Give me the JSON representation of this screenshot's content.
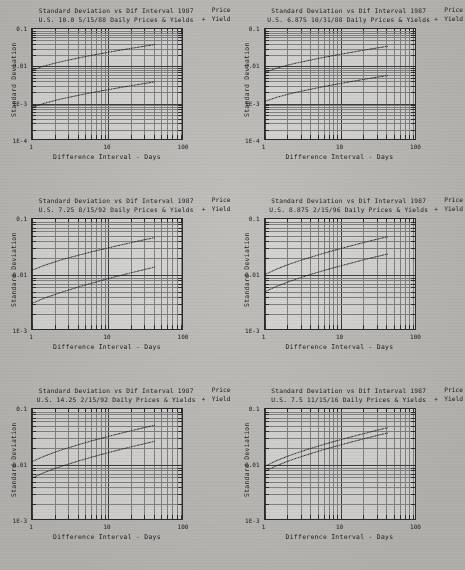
{
  "page": {
    "background_color": "#b9b8b4",
    "ink_color": "#1a1a1a",
    "layout": "2 columns x 3 rows of log-log scatter plots"
  },
  "common": {
    "title_line1": "Standard Deviation vs Dif Interval 1987",
    "xlabel": "Difference Interval - Days",
    "ylabel": "Standard Deviation",
    "xticks": [
      "1",
      "10",
      "100"
    ],
    "legend": {
      "price_label": "Price",
      "yield_label": "Yield",
      "marker": "+"
    }
  },
  "chart_data": [
    {
      "id": "panel-1",
      "type": "scatter",
      "title": "Standard Deviation vs Dif Interval 1987",
      "subtitle": "U.S. 10.0 5/15/88 Daily Prices & Yields",
      "xlabel": "Difference Interval - Days",
      "ylabel": "Standard Deviation",
      "xscale": "log",
      "yscale": "log",
      "xlim": [
        1,
        100
      ],
      "ylim": [
        0.0001,
        0.1
      ],
      "xticklabels": [
        "1",
        "10",
        "100"
      ],
      "yticklabels": [
        "0.1",
        "0.01",
        "1E-3",
        "1E-4"
      ],
      "grid": true,
      "legend_position": "top-right",
      "series": [
        {
          "name": "Price",
          "x": [
            1,
            1.4,
            2,
            2.6,
            3,
            4,
            5,
            6,
            7,
            8,
            9,
            10,
            12,
            14,
            16,
            18,
            20,
            24,
            28,
            32,
            36,
            40
          ],
          "y": [
            0.0082,
            0.0104,
            0.0126,
            0.0143,
            0.0152,
            0.0172,
            0.0189,
            0.0203,
            0.0215,
            0.0226,
            0.0236,
            0.0245,
            0.0262,
            0.0277,
            0.029,
            0.0302,
            0.0313,
            0.0333,
            0.035,
            0.0365,
            0.0379,
            0.0392
          ]
        },
        {
          "name": "Yield",
          "x": [
            1,
            1.4,
            2,
            2.6,
            3,
            4,
            5,
            6,
            7,
            8,
            9,
            10,
            12,
            14,
            16,
            18,
            20,
            24,
            28,
            32,
            36,
            40
          ],
          "y": [
            0.00082,
            0.00104,
            0.00126,
            0.00143,
            0.00152,
            0.00172,
            0.00189,
            0.00203,
            0.00215,
            0.00226,
            0.00236,
            0.00245,
            0.00262,
            0.00277,
            0.0029,
            0.00302,
            0.00313,
            0.00333,
            0.0035,
            0.00365,
            0.00379,
            0.00392
          ]
        }
      ]
    },
    {
      "id": "panel-2",
      "type": "scatter",
      "title": "Standard Deviation vs Dif Interval 1987",
      "subtitle": "U.S. 6.875 10/31/88 Daily Prices & Yields",
      "xlabel": "Difference Interval - Days",
      "ylabel": "Standard Deviation",
      "xscale": "log",
      "yscale": "log",
      "xlim": [
        1,
        100
      ],
      "ylim": [
        0.0001,
        0.1
      ],
      "xticklabels": [
        "1",
        "10",
        "100"
      ],
      "yticklabels": [
        "0.1",
        "0.01",
        "1E-3",
        "1E-4"
      ],
      "grid": true,
      "legend_position": "top-right",
      "series": [
        {
          "name": "Price",
          "x": [
            1,
            1.4,
            2,
            2.6,
            3,
            4,
            5,
            6,
            7,
            8,
            9,
            10,
            12,
            14,
            16,
            18,
            20,
            24,
            28,
            32,
            36,
            40
          ],
          "y": [
            0.0072,
            0.0092,
            0.0112,
            0.0127,
            0.0135,
            0.0153,
            0.0168,
            0.0181,
            0.0192,
            0.0202,
            0.0211,
            0.0219,
            0.0234,
            0.0248,
            0.026,
            0.0271,
            0.0281,
            0.0299,
            0.0315,
            0.0329,
            0.0342,
            0.0354
          ]
        },
        {
          "name": "Yield",
          "x": [
            1,
            1.4,
            2,
            2.6,
            3,
            4,
            5,
            6,
            7,
            8,
            9,
            10,
            12,
            14,
            16,
            18,
            20,
            24,
            28,
            32,
            36,
            40
          ],
          "y": [
            0.0012,
            0.00152,
            0.00185,
            0.0021,
            0.00223,
            0.00252,
            0.00277,
            0.00298,
            0.00317,
            0.00333,
            0.00348,
            0.00361,
            0.00386,
            0.00409,
            0.00429,
            0.00447,
            0.00463,
            0.00493,
            0.00519,
            0.00542,
            0.00563,
            0.00583
          ]
        }
      ]
    },
    {
      "id": "panel-3",
      "type": "scatter",
      "title": "Standard Deviation vs Dif Interval 1987",
      "subtitle": "U.S. 7.25 8/15/92 Daily Prices & Yields",
      "xlabel": "Difference Interval - Days",
      "ylabel": "Standard Deviation",
      "xscale": "log",
      "yscale": "log",
      "xlim": [
        1,
        100
      ],
      "ylim": [
        0.001,
        0.1
      ],
      "xticklabels": [
        "1",
        "10",
        "100"
      ],
      "yticklabels": [
        "0.1",
        "0.01",
        "1E-3"
      ],
      "grid": true,
      "legend_position": "top-right",
      "series": [
        {
          "name": "Price",
          "x": [
            1,
            1.4,
            2,
            2.6,
            3,
            4,
            5,
            6,
            7,
            8,
            9,
            10,
            12,
            14,
            16,
            18,
            20,
            24,
            28,
            32,
            36,
            40
          ],
          "y": [
            0.0125,
            0.015,
            0.0176,
            0.0196,
            0.0207,
            0.0229,
            0.0248,
            0.0264,
            0.0278,
            0.029,
            0.0301,
            0.0311,
            0.033,
            0.0346,
            0.0361,
            0.0374,
            0.0386,
            0.0408,
            0.0427,
            0.0444,
            0.0459,
            0.0473
          ]
        },
        {
          "name": "Yield",
          "x": [
            1,
            1.4,
            2,
            2.6,
            3,
            4,
            5,
            6,
            7,
            8,
            9,
            10,
            12,
            14,
            16,
            18,
            20,
            24,
            28,
            32,
            36,
            40
          ],
          "y": [
            0.0032,
            0.0039,
            0.0046,
            0.0052,
            0.0055,
            0.0062,
            0.0068,
            0.0073,
            0.0077,
            0.0081,
            0.0085,
            0.0088,
            0.0094,
            0.0099,
            0.0104,
            0.0108,
            0.0112,
            0.0119,
            0.0125,
            0.0131,
            0.0136,
            0.0141
          ]
        }
      ]
    },
    {
      "id": "panel-4",
      "type": "scatter",
      "title": "Standard Deviation vs Dif Interval 1987",
      "subtitle": "U.S. 8.875 2/15/96 Daily Prices & Yields",
      "xlabel": "Difference Interval - Days",
      "ylabel": "Standard Deviation",
      "xscale": "log",
      "yscale": "log",
      "xlim": [
        1,
        100
      ],
      "ylim": [
        0.001,
        0.1
      ],
      "xticklabels": [
        "1",
        "10",
        "100"
      ],
      "yticklabels": [
        "0.1",
        "0.01",
        "1E-3"
      ],
      "grid": true,
      "legend_position": "top-right",
      "series": [
        {
          "name": "Price",
          "x": [
            1,
            1.4,
            2,
            2.6,
            3,
            4,
            5,
            6,
            7,
            8,
            9,
            10,
            12,
            14,
            16,
            18,
            20,
            24,
            28,
            32,
            36,
            40
          ],
          "y": [
            0.0105,
            0.013,
            0.0157,
            0.0177,
            0.0189,
            0.0213,
            0.0234,
            0.0252,
            0.0267,
            0.0281,
            0.0293,
            0.0305,
            0.0326,
            0.0344,
            0.0361,
            0.0376,
            0.039,
            0.0415,
            0.0437,
            0.0456,
            0.0474,
            0.049
          ]
        },
        {
          "name": "Yield",
          "x": [
            1,
            1.4,
            2,
            2.6,
            3,
            4,
            5,
            6,
            7,
            8,
            9,
            10,
            12,
            14,
            16,
            18,
            20,
            24,
            28,
            32,
            36,
            40
          ],
          "y": [
            0.0052,
            0.0064,
            0.0077,
            0.0087,
            0.0093,
            0.0105,
            0.0115,
            0.0124,
            0.0131,
            0.0138,
            0.0144,
            0.015,
            0.016,
            0.0169,
            0.0177,
            0.0185,
            0.0192,
            0.0204,
            0.0215,
            0.0224,
            0.0233,
            0.0241
          ]
        }
      ]
    },
    {
      "id": "panel-5",
      "type": "scatter",
      "title": "Standard Deviation vs Dif Interval 1987",
      "subtitle": "U.S. 14.25 2/15/92 Daily Prices & Yields",
      "xlabel": "Difference Interval - Days",
      "ylabel": "Standard Deviation",
      "xscale": "log",
      "yscale": "log",
      "xlim": [
        1,
        100
      ],
      "ylim": [
        0.001,
        0.1
      ],
      "xticklabels": [
        "1",
        "10",
        "100"
      ],
      "yticklabels": [
        "0.1",
        "0.01",
        "1E-3"
      ],
      "grid": true,
      "legend_position": "top-right",
      "series": [
        {
          "name": "Price",
          "x": [
            1,
            1.4,
            2,
            2.6,
            3,
            4,
            5,
            6,
            7,
            8,
            9,
            10,
            12,
            14,
            16,
            18,
            20,
            24,
            28,
            32,
            36,
            40
          ],
          "y": [
            0.0118,
            0.0145,
            0.0174,
            0.0196,
            0.0208,
            0.0234,
            0.0256,
            0.0275,
            0.0291,
            0.0305,
            0.0318,
            0.033,
            0.0352,
            0.0371,
            0.0388,
            0.0404,
            0.0418,
            0.0444,
            0.0466,
            0.0486,
            0.0504,
            0.0521
          ]
        },
        {
          "name": "Yield",
          "x": [
            1,
            1.4,
            2,
            2.6,
            3,
            4,
            5,
            6,
            7,
            8,
            9,
            10,
            12,
            14,
            16,
            18,
            20,
            24,
            28,
            32,
            36,
            40
          ],
          "y": [
            0.006,
            0.0074,
            0.0089,
            0.01,
            0.0106,
            0.012,
            0.0131,
            0.0141,
            0.0149,
            0.0157,
            0.0163,
            0.017,
            0.0181,
            0.0191,
            0.02,
            0.0208,
            0.0216,
            0.0229,
            0.024,
            0.0251,
            0.026,
            0.0269
          ]
        }
      ]
    },
    {
      "id": "panel-6",
      "type": "scatter",
      "title": "Standard Deviation vs Dif Interval 1987",
      "subtitle": "U.S. 7.5 11/15/16 Daily Prices & Yields",
      "xlabel": "Difference Interval - Days",
      "ylabel": "Standard Deviation",
      "xscale": "log",
      "yscale": "log",
      "xlim": [
        1,
        100
      ],
      "ylim": [
        0.001,
        0.1
      ],
      "xticklabels": [
        "1",
        "10",
        "100"
      ],
      "yticklabels": [
        "0.1",
        "0.01",
        "1E-3"
      ],
      "grid": true,
      "legend_position": "top-right",
      "series": [
        {
          "name": "Price",
          "x": [
            1,
            1.4,
            2,
            2.6,
            3,
            4,
            5,
            6,
            7,
            8,
            9,
            10,
            12,
            14,
            16,
            18,
            20,
            24,
            28,
            32,
            36,
            40
          ],
          "y": [
            0.0098,
            0.0122,
            0.0148,
            0.0168,
            0.0179,
            0.0203,
            0.0223,
            0.024,
            0.0255,
            0.0268,
            0.028,
            0.0291,
            0.0311,
            0.0329,
            0.0345,
            0.0359,
            0.0373,
            0.0397,
            0.0418,
            0.0437,
            0.0454,
            0.047
          ]
        },
        {
          "name": "Yield",
          "x": [
            1,
            1.4,
            2,
            2.6,
            3,
            4,
            5,
            6,
            7,
            8,
            9,
            10,
            12,
            14,
            16,
            18,
            20,
            24,
            28,
            32,
            36,
            40
          ],
          "y": [
            0.008,
            0.0099,
            0.012,
            0.0136,
            0.0145,
            0.0164,
            0.018,
            0.0194,
            0.0206,
            0.0217,
            0.0226,
            0.0235,
            0.0251,
            0.0266,
            0.0278,
            0.029,
            0.0301,
            0.0321,
            0.0338,
            0.0353,
            0.0367,
            0.038
          ]
        }
      ]
    }
  ]
}
